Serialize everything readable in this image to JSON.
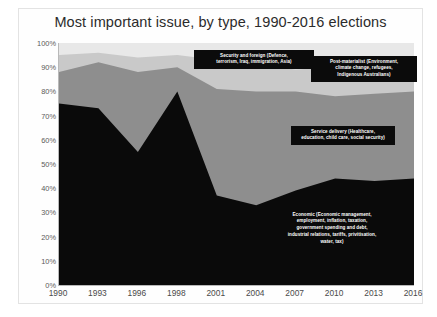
{
  "chart_data": {
    "type": "area",
    "stacked": true,
    "title": "Most important issue, by type, 1990-2016 elections",
    "xlabel": "",
    "ylabel": "",
    "ylim": [
      0,
      100
    ],
    "ytick_labels": [
      "100%",
      "90%",
      "80%",
      "70%",
      "60%",
      "50%",
      "40%",
      "30%",
      "20%",
      "10%",
      "0%"
    ],
    "ytick_values": [
      100,
      90,
      80,
      70,
      60,
      50,
      40,
      30,
      20,
      10,
      0
    ],
    "categories": [
      "1990",
      "1993",
      "1996",
      "1998",
      "2001",
      "2004",
      "2007",
      "2010",
      "2013",
      "2016"
    ],
    "x": [
      1990,
      1993,
      1996,
      1998,
      2001,
      2004,
      2007,
      2010,
      2013,
      2016
    ],
    "grid": false,
    "legend_position": "inline-annotations",
    "series": [
      {
        "name": "Economic",
        "label": "Economic (Economic management, employment, inflation, taxation, government spending and debt, industrial relations, tariffs, privatisation, water, tax)",
        "label_lines": [
          "Economic (Economic management,",
          "employment, inflation, taxation,",
          "government spending and debt,",
          "industrial relations, tariffs, privitisation,",
          "water, tax)"
        ],
        "color": "#0a0a0a",
        "values": [
          75,
          73,
          55,
          80,
          37,
          33,
          39,
          44,
          43,
          44
        ]
      },
      {
        "name": "Service delivery",
        "label": "Service delivery (Healthcare, education, child care, social security)",
        "label_lines": [
          "Service delivery (Healthcare,",
          "education, child care, social security)"
        ],
        "color": "#8e8e8e",
        "values": [
          13,
          19,
          33,
          10,
          44,
          47,
          41,
          34,
          36,
          36
        ]
      },
      {
        "name": "Security and foreign",
        "label": "Security and foreign (Defence, terrorism, Iraq, immigration, Asia)",
        "label_lines": [
          "Security and foreign (Defence,",
          "terrorism, Iraq, immigration, Asia)"
        ],
        "color": "#c9c9c9",
        "values": [
          7,
          4,
          6,
          5,
          12,
          11,
          9,
          12,
          11,
          12
        ]
      },
      {
        "name": "Post-materialist",
        "label": "Post-materialist (Environment, climate change, refugees, Indigenous Australians)",
        "label_lines": [
          "Post-materialist (Environment,",
          "climate change, refugees,",
          "Indigenous Australians)"
        ],
        "color": "#e8e8e8",
        "values": [
          5,
          4,
          6,
          5,
          7,
          9,
          11,
          10,
          10,
          8
        ]
      }
    ],
    "cumulative_tops": {
      "economic": [
        75,
        73,
        55,
        80,
        37,
        33,
        39,
        44,
        43,
        44
      ],
      "service": [
        88,
        92,
        88,
        90,
        81,
        80,
        80,
        78,
        79,
        80
      ],
      "security": [
        95,
        96,
        94,
        95,
        93,
        91,
        89,
        90,
        90,
        92
      ],
      "post": [
        100,
        100,
        100,
        100,
        100,
        100,
        100,
        100,
        100,
        100
      ]
    }
  }
}
